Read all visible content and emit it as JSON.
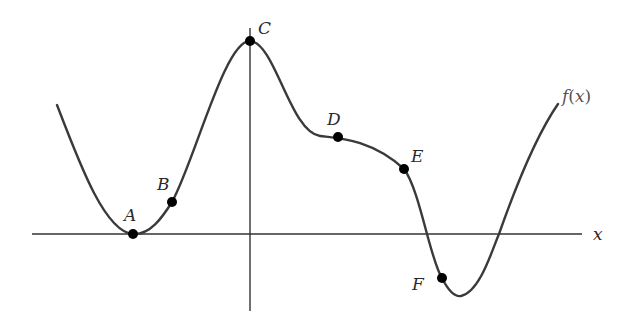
{
  "chart_data": {
    "type": "line",
    "title": "",
    "xlabel": "x",
    "ylabel": "",
    "curve_label": "f(x)",
    "grid": false,
    "legend": "none",
    "colors": {
      "curve": "#3a3a3a",
      "axes": "#333333",
      "points": "#000000"
    },
    "axes": {
      "x_axis": {
        "x1": 32,
        "x2": 582,
        "y": 234
      },
      "y_axis": {
        "x": 250,
        "y1": 28,
        "y2": 311
      }
    },
    "curve_path": "M57,105 C80,165 105,232 133,234 C150,235 162,218 172,202 C195,160 225,40 250,41 C275,42 290,132 320,136 C335,138 370,138 404,169 C420,190 430,260 442,278 C448,290 455,297 461,296 C480,292 492,250 499,234 C518,180 540,130 558,104",
    "points": [
      {
        "label": "A",
        "x": 133,
        "y": 234,
        "label_x": 124,
        "label_y": 221,
        "description": "local minimum touching x-axis"
      },
      {
        "label": "B",
        "x": 172,
        "y": 202,
        "label_x": 157,
        "label_y": 190,
        "description": "increasing, concave up"
      },
      {
        "label": "C",
        "x": 250,
        "y": 41,
        "label_x": 258,
        "label_y": 34,
        "description": "local maximum on y-axis"
      },
      {
        "label": "D",
        "x": 338,
        "y": 137,
        "label_x": 327,
        "label_y": 125,
        "description": "near-horizontal inflection"
      },
      {
        "label": "E",
        "x": 404,
        "y": 169,
        "label_x": 411,
        "label_y": 162,
        "description": "decreasing, concave down"
      },
      {
        "label": "F",
        "x": 442,
        "y": 278,
        "label_x": 412,
        "label_y": 290,
        "description": "below x-axis, decreasing"
      }
    ],
    "labels": {
      "x_axis_label": {
        "text": "x",
        "x": 593,
        "y": 240
      },
      "curve_label": {
        "text": "f(x)",
        "x": 562,
        "y": 102
      }
    }
  }
}
